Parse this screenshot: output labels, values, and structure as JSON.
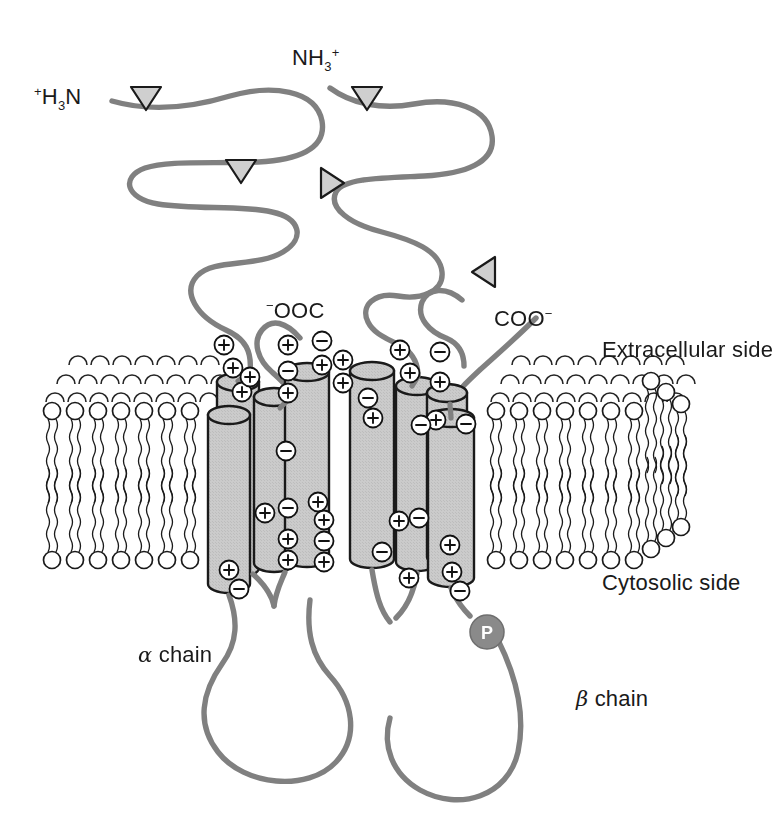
{
  "figure": {
    "type": "biology-diagram",
    "background_color": "#ffffff",
    "line_color": "#808080",
    "outline_color": "#1a1a1a",
    "cylinder_fill": "#c9c9c9"
  },
  "labels": {
    "n_term_alpha_pre": "+",
    "n_term_alpha": "H",
    "n_term_alpha_sub": "3",
    "n_term_alpha_post": "N",
    "n_term_beta": "NH",
    "n_term_beta_sub": "3",
    "n_term_beta_sup": "+",
    "c_term_alpha_pre": "−",
    "c_term_alpha": "OOC",
    "c_term_beta": "COO",
    "c_term_beta_sup": "−",
    "extracellular": "Extracellular side",
    "cytosolic": "Cytosolic side",
    "alpha_chain_greek": "α",
    "alpha_chain_text": " chain",
    "beta_chain_greek": "β",
    "beta_chain_text": " chain",
    "phosphate": "P"
  },
  "structure": {
    "chains": [
      {
        "name": "alpha chain",
        "n_terminus": "+H3N",
        "c_terminus": "-OOC",
        "helices": 4
      },
      {
        "name": "beta chain",
        "n_terminus": "NH3+",
        "c_terminus": "COO-",
        "helices": 4,
        "modification": "phosphate"
      }
    ],
    "membrane": {
      "leaflets": 2,
      "headgroup_shape": "circle",
      "tail_shape": "wavy-line",
      "front_row_lipids_left": 7,
      "front_row_lipids_right": 6
    },
    "glycosylation_markers": [
      {
        "id": "tri-1",
        "direction": "down",
        "x": 145,
        "y": 95
      },
      {
        "id": "tri-2",
        "direction": "down",
        "x": 366,
        "y": 95
      },
      {
        "id": "tri-3",
        "direction": "down",
        "x": 240,
        "y": 168
      },
      {
        "id": "tri-4",
        "direction": "right",
        "x": 330,
        "y": 180
      },
      {
        "id": "tri-5",
        "direction": "left",
        "x": 483,
        "y": 271
      }
    ],
    "charges": {
      "positive_symbol": "+",
      "negative_symbol": "−",
      "positive_count": 24,
      "negative_count": 13
    }
  }
}
